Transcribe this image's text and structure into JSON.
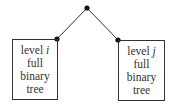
{
  "diagram": {
    "type": "tree",
    "nodes": [
      {
        "id": "root",
        "x": 87,
        "y": 8
      },
      {
        "id": "left",
        "x": 57,
        "y": 39
      },
      {
        "id": "right",
        "x": 118,
        "y": 40
      }
    ],
    "edges": [
      [
        "root",
        "left"
      ],
      [
        "root",
        "right"
      ]
    ],
    "left_box": {
      "line1_prefix": "level ",
      "line1_var": "i",
      "line2": "full",
      "line3": "binary",
      "line4": "tree"
    },
    "right_box": {
      "line1_prefix": "level ",
      "line1_var": "j",
      "line2": "full",
      "line3": "binary",
      "line4": "tree"
    },
    "colors": {
      "stroke": "#333333",
      "node": "#111111",
      "text": "#333333"
    }
  }
}
